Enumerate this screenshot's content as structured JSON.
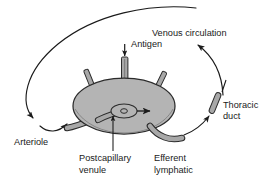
{
  "figure": {
    "background_color": "#ffffff",
    "width": 277,
    "height": 186
  },
  "colors": {
    "node_fill": "#b4b4b4",
    "node_stroke": "#2b2b2b",
    "vessel_fill": "#a8a8a8",
    "vessel_stroke": "#2b2b2b",
    "line": "#1a1a1a",
    "text": "#1a1a1a"
  },
  "labels": {
    "antigen": "Antigen",
    "venous_circulation": "Venous circulation",
    "thoracic_duct_line1": "Thoracic",
    "thoracic_duct_line2": "duct",
    "arteriole": "Arteriole",
    "postcapillary_line1": "Postcapillary",
    "postcapillary_line2": "venule",
    "efferent_line1": "Efferent",
    "efferent_line2": "lymphatic"
  },
  "structures": {
    "lymph_node": "lymph-node-ellipse",
    "afferent_lymphatic_central": "afferent-lymphatic-tube",
    "afferent_stub_left": "afferent-lymphatic-stub-left",
    "afferent_stub_right": "afferent-lymphatic-stub-right",
    "arteriole_vessel": "arteriole-vessel",
    "postcapillary_venule": "postcapillary-venule-ellipse",
    "efferent_lymphatic_vessel": "efferent-lymphatic-vessel",
    "thoracic_duct_segment": "thoracic-duct-capsule",
    "recirculation_loop": "lymphocyte-recirculation-arc"
  }
}
